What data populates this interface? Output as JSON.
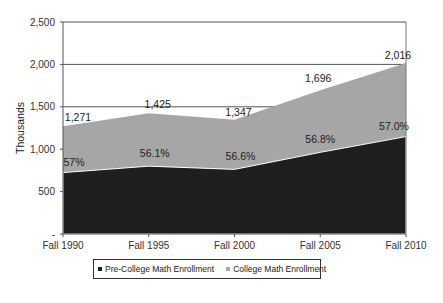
{
  "chart_data": {
    "type": "area",
    "stacked": false,
    "title": "",
    "xlabel": "",
    "ylabel": "Thousands",
    "ylim": [
      0,
      2500
    ],
    "yticks": [
      0,
      500,
      1000,
      1500,
      2000,
      2500
    ],
    "ytick_labels": [
      "-",
      "500",
      "1,000",
      "1,500",
      "2,000",
      "2,500"
    ],
    "categories": [
      "Fall 1990",
      "Fall 1995",
      "Fall 2000",
      "Fall 2005",
      "Fall 2010"
    ],
    "series": [
      {
        "name": "College Math Enrollment",
        "color": "#a6a6a6",
        "values": [
          1271,
          1425,
          1347,
          1696,
          2016
        ],
        "labels": [
          "1,271",
          "1,425",
          "1,347",
          "1,696",
          "2,016"
        ],
        "note": "total enrollment (outer area)"
      },
      {
        "name": "Pre-College Math Enrollment",
        "color": "#1f1f1f",
        "values": [
          724,
          800,
          762,
          963,
          1149
        ],
        "labels": [
          "57%",
          "56.1%",
          "56.6%",
          "56.8%",
          "57.0%"
        ],
        "note": "percent labels show pre-college share of total"
      }
    ],
    "grid": true,
    "legend_position": "bottom"
  },
  "legend": {
    "items": [
      {
        "label": "Pre-College Math Enrollment",
        "color": "#1f1f1f"
      },
      {
        "label": "College Math Enrollment",
        "color": "#a6a6a6"
      }
    ]
  }
}
